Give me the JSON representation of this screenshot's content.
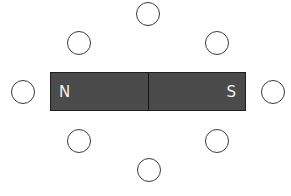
{
  "diagram": {
    "magnet": {
      "north_label": "N",
      "south_label": "S",
      "fill_color": "#4b4b4b",
      "border_color": "#1e1e1e",
      "label_color": "#f2f2f2"
    },
    "compass_positions": [
      {
        "id": "top",
        "cx": 148,
        "cy": 14
      },
      {
        "id": "upper-left",
        "cx": 79,
        "cy": 43
      },
      {
        "id": "upper-right",
        "cx": 217,
        "cy": 43
      },
      {
        "id": "left",
        "cx": 23,
        "cy": 92
      },
      {
        "id": "right",
        "cx": 273,
        "cy": 92
      },
      {
        "id": "lower-left",
        "cx": 79,
        "cy": 141
      },
      {
        "id": "lower-right",
        "cx": 217,
        "cy": 141
      },
      {
        "id": "bottom",
        "cx": 149,
        "cy": 170
      }
    ],
    "compass_count": 8
  }
}
